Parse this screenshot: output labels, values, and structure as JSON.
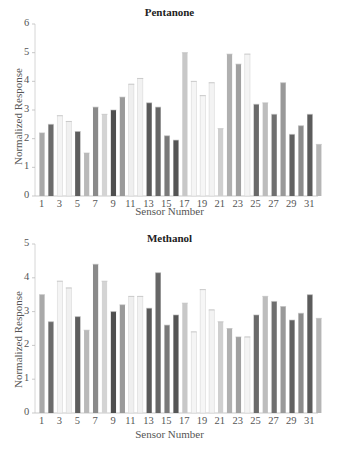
{
  "chart_data": [
    {
      "type": "bar",
      "title": "Pentanone",
      "xlabel": "Sensor Number",
      "ylabel": "Normalized Response",
      "ylim": [
        0,
        6
      ],
      "yticks": [
        0,
        1,
        2,
        3,
        4,
        5,
        6
      ],
      "xticks": [
        1,
        3,
        5,
        7,
        9,
        11,
        13,
        15,
        17,
        19,
        21,
        23,
        25,
        27,
        29,
        31
      ],
      "categories": [
        1,
        2,
        3,
        4,
        5,
        6,
        7,
        8,
        9,
        10,
        11,
        12,
        13,
        14,
        15,
        16,
        17,
        18,
        19,
        20,
        21,
        22,
        23,
        24,
        25,
        26,
        27,
        28,
        29,
        30,
        31,
        32
      ],
      "values": [
        2.2,
        2.5,
        2.8,
        2.6,
        2.25,
        1.5,
        3.1,
        2.85,
        3.0,
        3.45,
        3.9,
        4.1,
        3.25,
        3.1,
        2.1,
        1.95,
        5.0,
        4.0,
        3.5,
        3.95,
        2.35,
        4.95,
        4.6,
        4.95,
        3.2,
        3.25,
        2.85,
        3.95,
        2.15,
        2.45,
        2.85,
        1.8
      ],
      "grid": false,
      "legend": "none"
    },
    {
      "type": "bar",
      "title": "Methanol",
      "xlabel": "Sensor Number",
      "ylabel": "Normalized Response",
      "ylim": [
        0,
        5
      ],
      "yticks": [
        0,
        1,
        2,
        3,
        4,
        5
      ],
      "xticks": [
        1,
        3,
        5,
        7,
        9,
        11,
        13,
        15,
        17,
        19,
        21,
        23,
        25,
        27,
        29,
        31
      ],
      "categories": [
        1,
        2,
        3,
        4,
        5,
        6,
        7,
        8,
        9,
        10,
        11,
        12,
        13,
        14,
        15,
        16,
        17,
        18,
        19,
        20,
        21,
        22,
        23,
        24,
        25,
        26,
        27,
        28,
        29,
        30,
        31,
        32
      ],
      "values": [
        3.5,
        2.7,
        3.9,
        3.7,
        2.85,
        2.45,
        4.4,
        3.9,
        3.0,
        3.2,
        3.45,
        3.45,
        3.1,
        4.15,
        2.6,
        2.9,
        3.25,
        2.4,
        3.65,
        3.05,
        2.7,
        2.5,
        2.25,
        2.25,
        2.9,
        3.45,
        3.3,
        3.15,
        2.75,
        2.95,
        3.5,
        2.8
      ],
      "grid": false,
      "legend": "none"
    }
  ],
  "bar_colors": [
    "#a9a9a9",
    "#6b6b6b",
    "#f4f4f4",
    "#f0f0f0",
    "#5e5e5e",
    "#b9b9b9",
    "#8a8a8a",
    "#d4d4d4",
    "#4f4f4f",
    "#9a9a9a",
    "#efefef",
    "#f2f2f2",
    "#5a5a5a",
    "#666666",
    "#7a7a7a",
    "#555555",
    "#c8c8c8",
    "#f5f5f5",
    "#f6f6f6",
    "#f3f3f3",
    "#cfcfcf",
    "#b0b0b0",
    "#a0a0a0",
    "#f4f4f4",
    "#6a6a6a",
    "#bdbdbd",
    "#707070",
    "#999999",
    "#626262",
    "#8c8c8c",
    "#5c5c5c",
    "#b5b5b5"
  ]
}
